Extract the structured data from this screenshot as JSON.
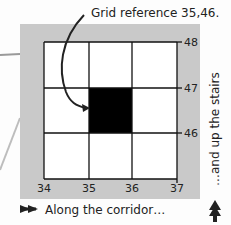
{
  "diagram": {
    "caption_top": "Grid reference 35,46.",
    "caption_bottom": "Along the corridor…",
    "caption_side": "…and up the stairs",
    "x_ticks": [
      "34",
      "35",
      "36",
      "37"
    ],
    "y_ticks": [
      "46",
      "47",
      "48"
    ],
    "highlighted_square": {
      "easting": 35,
      "northing": 46
    },
    "colors": {
      "panel": "#c9c9c9",
      "grid_fill": "#ffffff",
      "highlight": "#000000",
      "line": "#111111"
    },
    "icons": [
      "arrow-right-double-icon",
      "arrow-up-double-icon",
      "curved-pointer-arrow-icon"
    ]
  }
}
